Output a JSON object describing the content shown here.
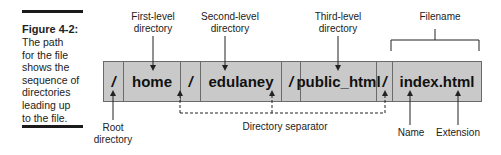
{
  "caption": {
    "title": "Figure 4-2:",
    "body_lines": [
      "The path",
      "for the file",
      "shows the",
      "sequence of",
      "directories",
      "leading up",
      "to the file."
    ]
  },
  "path_segments": [
    {
      "text": "/",
      "type": "separator",
      "width": 20
    },
    {
      "text": "home",
      "type": "directory",
      "width": 57
    },
    {
      "text": "/",
      "type": "separator",
      "width": 20
    },
    {
      "text": "edulaney",
      "type": "directory",
      "width": 81
    },
    {
      "text": "/",
      "type": "separator",
      "width": 19
    },
    {
      "text": "public_html",
      "type": "directory",
      "width": 76
    },
    {
      "text": "/",
      "type": "separator",
      "width": 16
    },
    {
      "text": "index.html",
      "type": "filename",
      "width": 90
    }
  ],
  "labels": {
    "first_level_line1": "First-level",
    "first_level_line2": "directory",
    "second_level_line1": "Second-level",
    "second_level_line2": "directory",
    "third_level_line1": "Third-level",
    "third_level_line2": "directory",
    "filename": "Filename",
    "root_line1": "Root",
    "root_line2": "directory",
    "directory_separator": "Directory separator",
    "name": "Name",
    "extension": "Extension"
  },
  "colors": {
    "box_fill": "#c9c9c9",
    "box_border": "#6a6a6a",
    "text": "#1a1a1a"
  }
}
